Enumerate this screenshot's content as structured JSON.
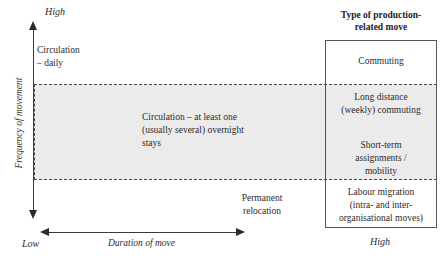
{
  "diagram": {
    "axes": {
      "y": {
        "title": "Frequency of movement",
        "high_label": "High",
        "low_label": "Low"
      },
      "x": {
        "title": "Duration of move",
        "high_label": "High"
      }
    },
    "zones": [
      {
        "name": "circulation-daily",
        "label": "Circulation\n– daily",
        "line1": "Circulation",
        "line2": "– daily"
      },
      {
        "name": "circulation-overnight",
        "label": "Circulation – at least one (usually several) overnight stays"
      },
      {
        "name": "permanent-relocation",
        "line1": "Permanent",
        "line2": "relocation"
      }
    ],
    "category_box": {
      "title_line1": "Type of production-",
      "title_line2": "related move",
      "items": [
        {
          "name": "commuting",
          "label": "Commuting"
        },
        {
          "name": "long-distance-commuting",
          "line1": "Long distance",
          "line2": "(weekly) commuting"
        },
        {
          "name": "short-term-assignments",
          "line1": "Short-term",
          "line2": "assignments /",
          "line3": "mobility"
        },
        {
          "name": "labour-migration",
          "line1": "Labour migration",
          "line2": "(intra- and inter-",
          "line3": "organisational moves)"
        }
      ]
    },
    "colors": {
      "shaded_band": "#ebebeb",
      "line": "#4a4a4a",
      "text": "#2b2b2b",
      "background": "#ffffff"
    }
  }
}
